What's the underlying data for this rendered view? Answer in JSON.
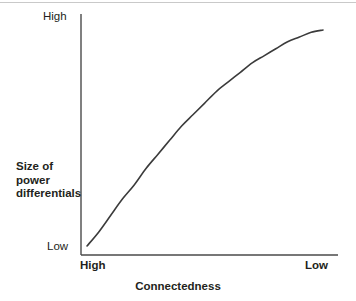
{
  "figure": {
    "background_color": "#ffffff",
    "ink_color": "#231f20",
    "axis_color": "#4a4a4a",
    "curve_color": "#3b3b3b",
    "top_rule_color": "#c9c9c9"
  },
  "chart_data": {
    "type": "line",
    "title": "",
    "subtitle": "",
    "xlabel": "Connectedness",
    "ylabel": "Size of power differentials",
    "ylabel_lines": [
      "Size of",
      "power",
      "differentials"
    ],
    "x_tick_labels": [
      "High",
      "Low"
    ],
    "y_tick_labels": [
      "High",
      "Low"
    ],
    "x_tick_left": "High",
    "x_tick_right": "Low",
    "y_tick_top": "High",
    "y_tick_bottom": "Low",
    "xlim": [
      0,
      1
    ],
    "ylim": [
      0,
      1
    ],
    "x_axis_direction": "High to Low",
    "y_axis_direction": "Low to High",
    "grid": false,
    "legend": null,
    "annotations": [],
    "series": [
      {
        "name": "power differentials vs connectedness",
        "shape": "concave-down increasing curve",
        "x": [
          0.0,
          0.05,
          0.1,
          0.15,
          0.2,
          0.25,
          0.3,
          0.35,
          0.4,
          0.45,
          0.5,
          0.55,
          0.6,
          0.65,
          0.7,
          0.75,
          0.8,
          0.85,
          0.9,
          0.95,
          1.0
        ],
        "y": [
          0.04,
          0.1,
          0.17,
          0.24,
          0.3,
          0.37,
          0.43,
          0.49,
          0.55,
          0.6,
          0.65,
          0.7,
          0.74,
          0.78,
          0.82,
          0.85,
          0.88,
          0.91,
          0.93,
          0.95,
          0.96
        ]
      }
    ]
  },
  "geometry": {
    "plot_left_px": 81,
    "plot_right_px": 338,
    "plot_top_px": 14,
    "plot_bottom_px": 255,
    "curve_start_px": [
      87,
      246
    ],
    "curve_end_px": [
      323,
      30
    ]
  }
}
